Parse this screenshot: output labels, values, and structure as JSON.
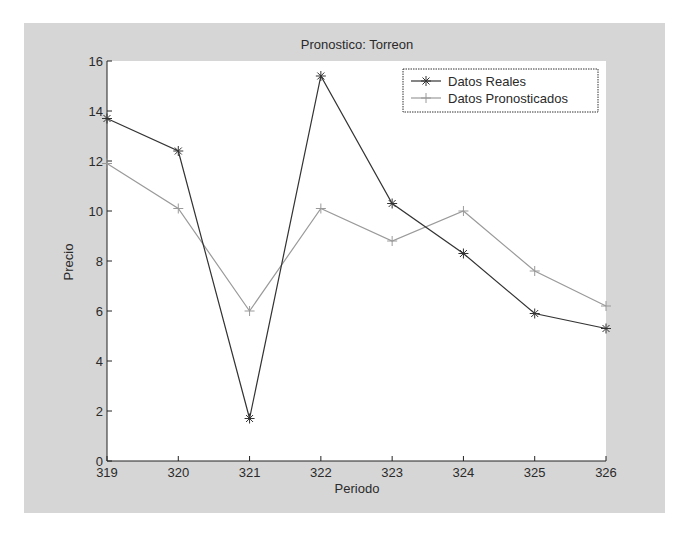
{
  "figure": {
    "background": "#d6d6d6",
    "plot_background": "#ffffff"
  },
  "chart_data": {
    "type": "line",
    "title": "Pronostico: Torreon",
    "xlabel": "Periodo",
    "ylabel": "Precio",
    "x": [
      319,
      320,
      321,
      322,
      323,
      324,
      325,
      326
    ],
    "x_tick_labels": [
      "319",
      "320",
      "321",
      "322",
      "323",
      "324",
      "325",
      "326"
    ],
    "y_tick_labels": [
      "0",
      "2",
      "4",
      "6",
      "8",
      "10",
      "12",
      "14",
      "16"
    ],
    "xlim": [
      319,
      326
    ],
    "ylim": [
      0,
      16
    ],
    "grid": false,
    "legend_position": "upper right",
    "series": [
      {
        "name": "Datos Reales",
        "marker": "*",
        "color": "#333333",
        "values": [
          13.7,
          12.4,
          1.7,
          15.4,
          10.3,
          8.3,
          5.9,
          5.3
        ]
      },
      {
        "name": "Datos Pronosticados",
        "marker": "+",
        "color": "#9a9a9a",
        "values": [
          11.9,
          10.1,
          6.0,
          10.1,
          8.8,
          10.0,
          7.6,
          6.2
        ]
      }
    ]
  }
}
